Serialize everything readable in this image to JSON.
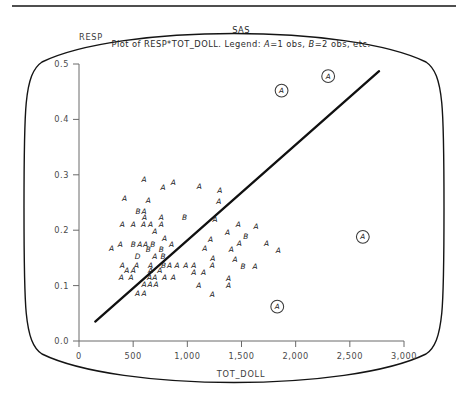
{
  "window": {
    "app_title": "SAS"
  },
  "titles": {
    "line1": "SAS",
    "line2_prefix": "Plot of RESP*TOT_DOLL. Legend: ",
    "legend_a": "A",
    "legend_a_text": "=1 obs, ",
    "legend_b": "B",
    "legend_b_text": "=2 obs, etc."
  },
  "chart_data": {
    "type": "scatter",
    "title": "Plot of RESP*TOT_DOLL. Legend: A=1 obs, B=2 obs, etc.",
    "subtitle": "SAS",
    "xlabel": "TOT_DOLL",
    "ylabel": "RESP",
    "xlim": [
      0,
      3000
    ],
    "ylim": [
      0.0,
      0.5
    ],
    "grid": false,
    "legend_position": "title",
    "legend_entries": [
      {
        "symbol": "A",
        "meaning": "1 obs"
      },
      {
        "symbol": "B",
        "meaning": "2 obs"
      },
      {
        "symbol": "D",
        "meaning": "4 obs"
      }
    ],
    "xticks": [
      0,
      500,
      1000,
      1500,
      2000,
      2500,
      3000
    ],
    "xtick_labels": [
      "0",
      "500",
      "1,000",
      "1,500",
      "2,000",
      "2,500",
      "3,000"
    ],
    "yticks": [
      0.0,
      0.1,
      0.2,
      0.3,
      0.4,
      0.5
    ],
    "ytick_labels": [
      "0.0",
      "0.1",
      "0.2",
      "0.3",
      "0.4",
      "0.5"
    ],
    "regression_line": {
      "x0": 150,
      "y0": 0.035,
      "x1": 2770,
      "y1": 0.487
    },
    "points": [
      {
        "x": 600,
        "y": 0.287,
        "label": "A"
      },
      {
        "x": 870,
        "y": 0.281,
        "label": "A"
      },
      {
        "x": 775,
        "y": 0.272,
        "label": "A"
      },
      {
        "x": 1110,
        "y": 0.275,
        "label": "A"
      },
      {
        "x": 1300,
        "y": 0.268,
        "label": "A"
      },
      {
        "x": 420,
        "y": 0.252,
        "label": "A"
      },
      {
        "x": 640,
        "y": 0.25,
        "label": "A"
      },
      {
        "x": 1290,
        "y": 0.247,
        "label": "A"
      },
      {
        "x": 545,
        "y": 0.23,
        "label": "B"
      },
      {
        "x": 600,
        "y": 0.23,
        "label": "A"
      },
      {
        "x": 605,
        "y": 0.218,
        "label": "A"
      },
      {
        "x": 760,
        "y": 0.218,
        "label": "A"
      },
      {
        "x": 975,
        "y": 0.218,
        "label": "B"
      },
      {
        "x": 1255,
        "y": 0.214,
        "label": "A"
      },
      {
        "x": 400,
        "y": 0.205,
        "label": "A"
      },
      {
        "x": 500,
        "y": 0.205,
        "label": "A"
      },
      {
        "x": 595,
        "y": 0.205,
        "label": "A"
      },
      {
        "x": 660,
        "y": 0.205,
        "label": "A"
      },
      {
        "x": 760,
        "y": 0.205,
        "label": "A"
      },
      {
        "x": 1470,
        "y": 0.205,
        "label": "A"
      },
      {
        "x": 1635,
        "y": 0.203,
        "label": "A"
      },
      {
        "x": 700,
        "y": 0.193,
        "label": "A"
      },
      {
        "x": 1370,
        "y": 0.192,
        "label": "A"
      },
      {
        "x": 1540,
        "y": 0.185,
        "label": "B"
      },
      {
        "x": 790,
        "y": 0.18,
        "label": "A"
      },
      {
        "x": 1215,
        "y": 0.178,
        "label": "A"
      },
      {
        "x": 1480,
        "y": 0.172,
        "label": "A"
      },
      {
        "x": 1730,
        "y": 0.172,
        "label": "A"
      },
      {
        "x": 380,
        "y": 0.17,
        "label": "A"
      },
      {
        "x": 500,
        "y": 0.17,
        "label": "B"
      },
      {
        "x": 560,
        "y": 0.17,
        "label": "A"
      },
      {
        "x": 615,
        "y": 0.17,
        "label": "A"
      },
      {
        "x": 680,
        "y": 0.17,
        "label": "B"
      },
      {
        "x": 855,
        "y": 0.17,
        "label": "A"
      },
      {
        "x": 300,
        "y": 0.162,
        "label": "A"
      },
      {
        "x": 640,
        "y": 0.16,
        "label": "B"
      },
      {
        "x": 760,
        "y": 0.16,
        "label": "B"
      },
      {
        "x": 1160,
        "y": 0.162,
        "label": "A"
      },
      {
        "x": 1405,
        "y": 0.16,
        "label": "A"
      },
      {
        "x": 1840,
        "y": 0.158,
        "label": "A"
      },
      {
        "x": 540,
        "y": 0.148,
        "label": "D"
      },
      {
        "x": 700,
        "y": 0.148,
        "label": "A"
      },
      {
        "x": 775,
        "y": 0.148,
        "label": "B"
      },
      {
        "x": 1235,
        "y": 0.145,
        "label": "A"
      },
      {
        "x": 1440,
        "y": 0.143,
        "label": "A"
      },
      {
        "x": 400,
        "y": 0.132,
        "label": "A"
      },
      {
        "x": 530,
        "y": 0.132,
        "label": "A"
      },
      {
        "x": 660,
        "y": 0.132,
        "label": "A"
      },
      {
        "x": 780,
        "y": 0.132,
        "label": "B"
      },
      {
        "x": 835,
        "y": 0.132,
        "label": "A"
      },
      {
        "x": 905,
        "y": 0.132,
        "label": "A"
      },
      {
        "x": 985,
        "y": 0.132,
        "label": "A"
      },
      {
        "x": 1060,
        "y": 0.132,
        "label": "A"
      },
      {
        "x": 1230,
        "y": 0.132,
        "label": "A"
      },
      {
        "x": 1515,
        "y": 0.13,
        "label": "B"
      },
      {
        "x": 1625,
        "y": 0.13,
        "label": "A"
      },
      {
        "x": 440,
        "y": 0.122,
        "label": "A"
      },
      {
        "x": 500,
        "y": 0.122,
        "label": "A"
      },
      {
        "x": 660,
        "y": 0.122,
        "label": "A"
      },
      {
        "x": 745,
        "y": 0.122,
        "label": "A"
      },
      {
        "x": 1060,
        "y": 0.12,
        "label": "A"
      },
      {
        "x": 1150,
        "y": 0.12,
        "label": "A"
      },
      {
        "x": 390,
        "y": 0.11,
        "label": "A"
      },
      {
        "x": 480,
        "y": 0.11,
        "label": "A"
      },
      {
        "x": 650,
        "y": 0.11,
        "label": "A"
      },
      {
        "x": 700,
        "y": 0.11,
        "label": "A"
      },
      {
        "x": 790,
        "y": 0.11,
        "label": "A"
      },
      {
        "x": 870,
        "y": 0.11,
        "label": "A"
      },
      {
        "x": 1380,
        "y": 0.108,
        "label": "A"
      },
      {
        "x": 600,
        "y": 0.098,
        "label": "A"
      },
      {
        "x": 655,
        "y": 0.098,
        "label": "A"
      },
      {
        "x": 710,
        "y": 0.098,
        "label": "A"
      },
      {
        "x": 1105,
        "y": 0.095,
        "label": "A"
      },
      {
        "x": 1380,
        "y": 0.095,
        "label": "A"
      },
      {
        "x": 540,
        "y": 0.082,
        "label": "A"
      },
      {
        "x": 600,
        "y": 0.082,
        "label": "A"
      },
      {
        "x": 1230,
        "y": 0.08,
        "label": "A"
      }
    ],
    "outliers": [
      {
        "x": 1870,
        "y": 0.452,
        "label": "A"
      },
      {
        "x": 2300,
        "y": 0.478,
        "label": "A"
      },
      {
        "x": 2620,
        "y": 0.188,
        "label": "A"
      },
      {
        "x": 1830,
        "y": 0.062,
        "label": "A"
      }
    ]
  }
}
